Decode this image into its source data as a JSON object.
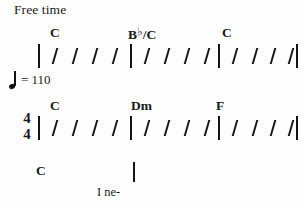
{
  "page": {
    "width": 307,
    "height": 208,
    "background": "#fefefe",
    "ink": "#1a1a1a"
  },
  "expression": {
    "free_time": "Free time"
  },
  "tempo": {
    "note_icon": "quarter-note-icon",
    "text": "= 110",
    "bpm": "110"
  },
  "time_signature": {
    "numerator": "4",
    "denominator": "4"
  },
  "systems": [
    {
      "id": "system-1",
      "y_chord": 26,
      "y_staff": 44,
      "has_time_signature": false,
      "measures": [
        {
          "chord": {
            "root": "C",
            "accidental": "",
            "bass": ""
          },
          "chord_text": "C",
          "chord_x": 50,
          "bar_x": 38,
          "slash_count": 4,
          "slashes_x": [
            54,
            74,
            94,
            114
          ]
        },
        {
          "chord": {
            "root": "B",
            "accidental": "♭",
            "bass": "C"
          },
          "chord_text": "B♭/C",
          "chord_x": 128,
          "bar_x": 130,
          "slash_count": 4,
          "slashes_x": [
            146,
            166,
            186,
            206
          ]
        },
        {
          "chord": {
            "root": "C",
            "accidental": "",
            "bass": ""
          },
          "chord_text": "C",
          "chord_x": 222,
          "bar_x": 218,
          "slash_count": 4,
          "slashes_x": [
            234,
            254,
            272,
            290
          ]
        }
      ],
      "end_bar_x": 296
    },
    {
      "id": "system-2",
      "y_chord": 99,
      "y_staff": 116,
      "has_time_signature": true,
      "measures": [
        {
          "chord": {
            "root": "C",
            "accidental": "",
            "bass": ""
          },
          "chord_text": "C",
          "chord_x": 50,
          "bar_x": 38,
          "slash_count": 4,
          "slashes_x": [
            54,
            74,
            94,
            114
          ]
        },
        {
          "chord": {
            "root": "D",
            "accidental": "",
            "bass": "",
            "quality": "m"
          },
          "chord_text": "Dm",
          "chord_x": 131,
          "bar_x": 130,
          "slash_count": 4,
          "slashes_x": [
            146,
            166,
            186,
            206
          ]
        },
        {
          "chord": {
            "root": "F",
            "accidental": "",
            "bass": ""
          },
          "chord_text": "F",
          "chord_x": 216,
          "bar_x": 218,
          "slash_count": 4,
          "slashes_x": [
            234,
            254,
            272,
            290
          ]
        }
      ],
      "end_bar_x": 296
    },
    {
      "id": "system-3",
      "y_chord": 164,
      "y_staff": 162,
      "has_time_signature": false,
      "measures": [
        {
          "chord": {
            "root": "C",
            "accidental": "",
            "bass": ""
          },
          "chord_text": "C",
          "chord_x": 36,
          "bar_x": null,
          "slash_count": 0,
          "slashes_x": []
        }
      ],
      "pickup_bar_x": 133,
      "end_bar_x": null
    }
  ],
  "lyrics": [
    {
      "text": "I ne-",
      "x": 97,
      "y": 186
    }
  ]
}
